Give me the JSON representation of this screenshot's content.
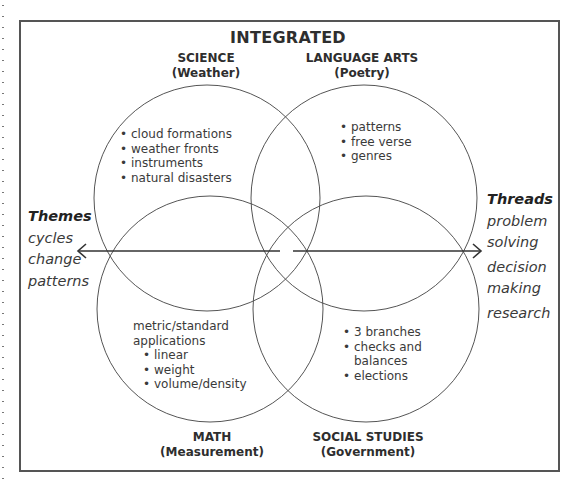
{
  "title": "INTEGRATED",
  "circles": {
    "science": {
      "subject": "SCIENCE",
      "topic": "(Weather)",
      "items": [
        "cloud formations",
        "weather fronts",
        "instruments",
        "natural disasters"
      ]
    },
    "language_arts": {
      "subject": "LANGUAGE ARTS",
      "topic": "(Poetry)",
      "items": [
        "patterns",
        "free verse",
        "genres"
      ]
    },
    "math": {
      "subject": "MATH",
      "topic": "(Measurement)",
      "intro_line1": "metric/standard",
      "intro_line2": "applications",
      "items": [
        "linear",
        "weight",
        "volume/density"
      ]
    },
    "social_studies": {
      "subject": "SOCIAL STUDIES",
      "topic": "(Government)",
      "items_line1": "3 branches",
      "items_line2a": "checks and",
      "items_line2b": "balances",
      "items_line3": "elections"
    }
  },
  "themes": {
    "heading": "Themes",
    "items": [
      "cycles",
      "change",
      "patterns"
    ]
  },
  "threads": {
    "heading": "Threads",
    "lines": [
      "problem",
      "solving",
      "decision",
      "making",
      "research"
    ]
  },
  "colors": {
    "stroke": "#555555",
    "text": "#2e2e2e"
  }
}
